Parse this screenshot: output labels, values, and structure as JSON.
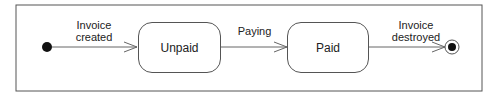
{
  "diagram": {
    "type": "UML state diagram",
    "states": [
      {
        "id": "initial",
        "kind": "initial-state"
      },
      {
        "id": "unpaid",
        "label": "Unpaid"
      },
      {
        "id": "paid",
        "label": "Paid"
      },
      {
        "id": "final",
        "kind": "final-state"
      }
    ],
    "transitions": [
      {
        "from": "initial",
        "to": "unpaid",
        "label_line1": "Invoice",
        "label_line2": "created"
      },
      {
        "from": "unpaid",
        "to": "paid",
        "label_line1": "Paying"
      },
      {
        "from": "paid",
        "to": "final",
        "label_line1": "Invoice",
        "label_line2": "destroyed"
      }
    ]
  }
}
